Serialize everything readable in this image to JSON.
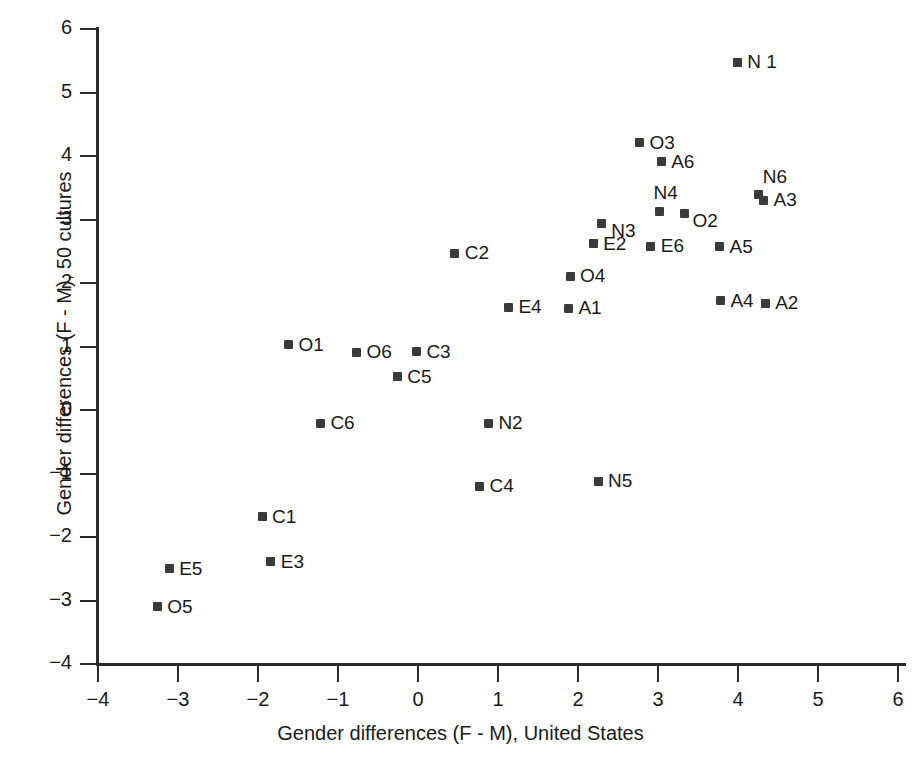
{
  "chart_data": {
    "type": "scatter",
    "title": "",
    "xlabel": "Gender differences (F - M), United States",
    "ylabel": "Gender differences (F - M), 50 cultures",
    "xlim": [
      -4,
      6
    ],
    "ylim": [
      -4,
      6
    ],
    "xticks": [
      "−4",
      "−3",
      "−2",
      "−1",
      "0",
      "1",
      "2",
      "3",
      "4",
      "5",
      "6"
    ],
    "yticks": [
      "6",
      "5",
      "4",
      "3",
      "2",
      "1",
      "0",
      "−1",
      "−2",
      "−3",
      "−4"
    ],
    "grid": false,
    "legend": "none",
    "marker": "square",
    "marker_color": "#3a3a3a",
    "points": [
      {
        "label": "N 1",
        "x": 3.99,
        "y": 5.48,
        "lx": 10,
        "ly": -11
      },
      {
        "label": "O3",
        "x": 2.77,
        "y": 4.21,
        "lx": 10,
        "ly": -11
      },
      {
        "label": "A6",
        "x": 3.04,
        "y": 3.91,
        "lx": 10,
        "ly": -11
      },
      {
        "label": "N6",
        "x": 4.26,
        "y": 3.4,
        "lx": 4,
        "ly": -28
      },
      {
        "label": "A3",
        "x": 4.32,
        "y": 3.3,
        "lx": 10,
        "ly": -11
      },
      {
        "label": "N4",
        "x": 3.02,
        "y": 3.12,
        "lx": -6,
        "ly": -30
      },
      {
        "label": "O2",
        "x": 3.33,
        "y": 3.09,
        "lx": 8,
        "ly": -4
      },
      {
        "label": "N3",
        "x": 2.29,
        "y": 2.93,
        "lx": 10,
        "ly": -4
      },
      {
        "label": "A5",
        "x": 3.77,
        "y": 2.57,
        "lx": 10,
        "ly": -11
      },
      {
        "label": "E6",
        "x": 2.91,
        "y": 2.58,
        "lx": 10,
        "ly": -11
      },
      {
        "label": "E2",
        "x": 2.19,
        "y": 2.62,
        "lx": 10,
        "ly": -11
      },
      {
        "label": "C2",
        "x": 0.46,
        "y": 2.47,
        "lx": 10,
        "ly": -11
      },
      {
        "label": "O4",
        "x": 1.9,
        "y": 2.11,
        "lx": 10,
        "ly": -11
      },
      {
        "label": "A4",
        "x": 3.78,
        "y": 1.72,
        "lx": 10,
        "ly": -11
      },
      {
        "label": "A2",
        "x": 4.34,
        "y": 1.68,
        "lx": 10,
        "ly": -11
      },
      {
        "label": "E4",
        "x": 1.13,
        "y": 1.62,
        "lx": 10,
        "ly": -11
      },
      {
        "label": "A1",
        "x": 1.88,
        "y": 1.6,
        "lx": 10,
        "ly": -11
      },
      {
        "label": "O1",
        "x": -1.62,
        "y": 1.03,
        "lx": 10,
        "ly": -11
      },
      {
        "label": "O6",
        "x": -0.77,
        "y": 0.91,
        "lx": 10,
        "ly": -11
      },
      {
        "label": "C3",
        "x": -0.02,
        "y": 0.92,
        "lx": 10,
        "ly": -11
      },
      {
        "label": "C5",
        "x": -0.26,
        "y": 0.52,
        "lx": 10,
        "ly": -11
      },
      {
        "label": "C6",
        "x": -1.22,
        "y": -0.21,
        "lx": 10,
        "ly": -11
      },
      {
        "label": "N2",
        "x": 0.88,
        "y": -0.21,
        "lx": 10,
        "ly": -11
      },
      {
        "label": "C4",
        "x": 0.77,
        "y": -1.2,
        "lx": 10,
        "ly": -11
      },
      {
        "label": "N5",
        "x": 2.25,
        "y": -1.12,
        "lx": 10,
        "ly": -11
      },
      {
        "label": "C1",
        "x": -1.95,
        "y": -1.68,
        "lx": 10,
        "ly": -11
      },
      {
        "label": "E3",
        "x": -1.84,
        "y": -2.39,
        "lx": 10,
        "ly": -11
      },
      {
        "label": "E5",
        "x": -3.11,
        "y": -2.5,
        "lx": 10,
        "ly": -11
      },
      {
        "label": "O5",
        "x": -3.26,
        "y": -3.1,
        "lx": 10,
        "ly": -11
      }
    ]
  },
  "axes": {
    "x_origin_px": 418,
    "x_unit_px": 80,
    "y_origin_px": 410,
    "y_unit_px": 63.5
  }
}
